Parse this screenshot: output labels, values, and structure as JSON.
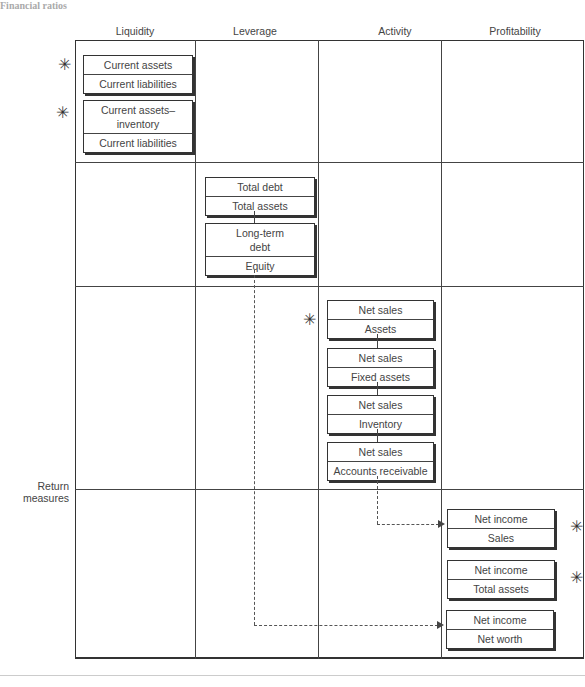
{
  "caption": "Financial ratios",
  "columns": [
    "Liquidity",
    "Leverage",
    "Activity",
    "Profitability"
  ],
  "row_label": "Return measures",
  "ratios": {
    "liquidity": [
      {
        "numerator": "Current assets",
        "denominator": "Current liabilities"
      },
      {
        "numerator": "Current assets–inventory",
        "denominator": "Current liabilities"
      }
    ],
    "leverage": [
      {
        "numerator": "Total debt",
        "denominator": "Total assets"
      },
      {
        "numerator": "Long-term debt",
        "denominator": "Equity"
      }
    ],
    "activity": [
      {
        "numerator": "Net sales",
        "denominator": "Assets"
      },
      {
        "numerator": "Net sales",
        "denominator": "Fixed assets"
      },
      {
        "numerator": "Net sales",
        "denominator": "Inventory"
      },
      {
        "numerator": "Net sales",
        "denominator": "Accounts receivable"
      }
    ],
    "profitability": [
      {
        "numerator": "Net income",
        "denominator": "Sales"
      },
      {
        "numerator": "Net income",
        "denominator": "Total assets"
      },
      {
        "numerator": "Net income",
        "denominator": "Net worth"
      }
    ]
  },
  "marks": {
    "star_glyph": "✳"
  }
}
